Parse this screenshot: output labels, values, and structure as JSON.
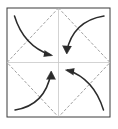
{
  "figure": {
    "background_color": "#ffffff",
    "canvas": {
      "width": 118,
      "height": 129
    }
  },
  "sheet": {
    "name": "paper-square",
    "stroke_color": "#3a3a3a",
    "stroke_width": 1,
    "fill_color": "#ffffff",
    "x": 7,
    "y": 8,
    "width": 103,
    "height": 109
  },
  "center_lines": {
    "name": "center-crease-lines",
    "stroke_color": "#c8c8c8",
    "stroke_width": 0.8,
    "vertical": {
      "x": 58.5,
      "y1": 8,
      "y2": 117
    },
    "horizontal": {
      "y": 62.5,
      "x1": 7,
      "x2": 110
    }
  },
  "diamond": {
    "name": "dashed-diamond-crease",
    "stroke_color": "#a0a0a0",
    "stroke_width": 1,
    "dash_pattern": "2.2 2.6",
    "points": "58.5,8 110,62.5 58.5,117 7,62.5",
    "vertex_labels": [
      "top-midpoint",
      "right-midpoint",
      "bottom-midpoint",
      "left-midpoint"
    ]
  },
  "arrows": [
    {
      "name": "fold-arrow-top-left",
      "quadrant": "top-left",
      "direction": "down-right toward center",
      "stroke_color": "#2b2b2b",
      "stroke_width": 1.5,
      "path": "M 14.5,16 C 20,34 30,48 50.5,55",
      "head": "M 44.5,50.5 L 52.5,55.5 L 43.5,56.5",
      "start": [
        14.5,
        16
      ],
      "end": [
        52.5,
        55.5
      ]
    },
    {
      "name": "fold-arrow-top-right",
      "quadrant": "top-right",
      "direction": "left then down toward center",
      "stroke_color": "#2b2b2b",
      "stroke_width": 1.5,
      "path": "M 104,16 C 85,19 71,30 66.5,52",
      "head": "M 62.5,45.5 L 66.8,54 L 71.5,46",
      "start": [
        104,
        16
      ],
      "end": [
        66.8,
        54
      ]
    },
    {
      "name": "fold-arrow-bottom-left",
      "quadrant": "bottom-left",
      "direction": "right then up toward center",
      "stroke_color": "#2b2b2b",
      "stroke_width": 1.5,
      "path": "M 15,110 C 34,107 47,95 51,73",
      "head": "M 46.5,79.5 L 51.2,71 L 55.5,79.5",
      "start": [
        15,
        110
      ],
      "end": [
        51.2,
        71
      ]
    },
    {
      "name": "fold-arrow-bottom-right",
      "quadrant": "bottom-right",
      "direction": "up-left toward center",
      "stroke_color": "#2b2b2b",
      "stroke_width": 1.5,
      "path": "M 103.5,110 C 98,92 88,77 67.5,70",
      "head": "M 73.5,75 L 65.5,70 L 74.5,68.5",
      "start": [
        103.5,
        110
      ],
      "end": [
        65.5,
        70
      ]
    }
  ]
}
